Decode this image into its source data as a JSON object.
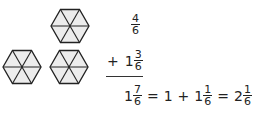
{
  "diagram": {
    "hexagons": [
      {
        "label": "hexagon-top",
        "cx": 70,
        "cy": 26,
        "r": 19,
        "parts": 6
      },
      {
        "label": "hexagon-bottom-left",
        "cx": 22,
        "cy": 67,
        "r": 19,
        "parts": 6
      },
      {
        "label": "hexagon-bottom-right",
        "cx": 69,
        "cy": 67,
        "r": 19,
        "parts": 6
      }
    ],
    "colors": {
      "stroke": "#222222",
      "fill": "#ececec"
    }
  },
  "addition": {
    "addend1": {
      "num": "4",
      "den": "6"
    },
    "operator": "+",
    "addend2": {
      "whole": "1",
      "num": "3",
      "den": "6"
    },
    "result": {
      "sum": {
        "whole": "1",
        "num": "7",
        "den": "6"
      },
      "eq1": "=",
      "step_whole": "1",
      "plus": "+",
      "step_mixed": {
        "whole": "1",
        "num": "1",
        "den": "6"
      },
      "eq2": "=",
      "final": {
        "whole": "2",
        "num": "1",
        "den": "6"
      }
    }
  }
}
